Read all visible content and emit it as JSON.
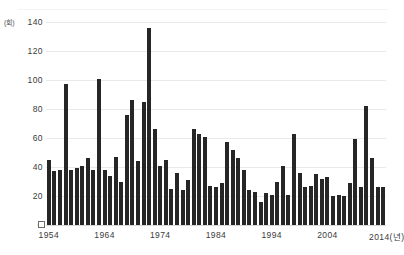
{
  "chart_data": {
    "type": "bar",
    "title": "",
    "subtitle": "",
    "xlabel": "2014(년)",
    "ylabel": "",
    "unit_label": "(회)",
    "ylim": [
      0,
      140
    ],
    "y_ticks": [
      0,
      20,
      40,
      60,
      80,
      100,
      120,
      140
    ],
    "x_ticks": [
      "1954",
      "1964",
      "1974",
      "1984",
      "1994",
      "2004",
      "2014(년)"
    ],
    "x_tick_years": [
      1954,
      1964,
      1974,
      1984,
      1994,
      2004,
      2014
    ],
    "grid": true,
    "legend": "none",
    "bar_color": "#262626",
    "grid_color": "#e9e9e9",
    "axis_text_color": "#3a3a3a",
    "categories": [
      "1954",
      "1955",
      "1956",
      "1957",
      "1958",
      "1959",
      "1960",
      "1961",
      "1962",
      "1963",
      "1964",
      "1965",
      "1966",
      "1967",
      "1968",
      "1969",
      "1970",
      "1971",
      "1972",
      "1973",
      "1974",
      "1975",
      "1976",
      "1977",
      "1978",
      "1979",
      "1980",
      "1981",
      "1982",
      "1983",
      "1984",
      "1985",
      "1986",
      "1987",
      "1988",
      "1989",
      "1990",
      "1991",
      "1992",
      "1993",
      "1994",
      "1995",
      "1996",
      "1997",
      "1998",
      "1999",
      "2000",
      "2001",
      "2002",
      "2003",
      "2004",
      "2005",
      "2006",
      "2007",
      "2008",
      "2009",
      "2010",
      "2011",
      "2012",
      "2013",
      "2014"
    ],
    "values": [
      45,
      37,
      38,
      97,
      38,
      39,
      41,
      46,
      38,
      101,
      38,
      34,
      47,
      30,
      76,
      86,
      44,
      85,
      136,
      66,
      41,
      45,
      25,
      36,
      24,
      31,
      66,
      63,
      61,
      27,
      26,
      29,
      57,
      52,
      46,
      38,
      24,
      23,
      16,
      22,
      21,
      30,
      41,
      21,
      63,
      36,
      26,
      27,
      35,
      32,
      33,
      20,
      21,
      20,
      29,
      59,
      26,
      82,
      46,
      26,
      26
    ],
    "peaks": [
      {
        "year": "1972",
        "value": 136
      },
      {
        "year": "1963",
        "value": 101
      },
      {
        "year": "1957",
        "value": 97
      },
      {
        "year": "1969",
        "value": 86
      },
      {
        "year": "1971",
        "value": 85
      },
      {
        "year": "2011",
        "value": 82
      }
    ]
  }
}
